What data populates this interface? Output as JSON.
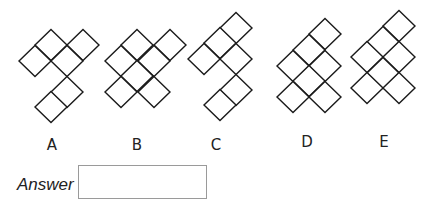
{
  "puzzle": {
    "cell": {
      "half_width": 16,
      "half_height": 15.5
    },
    "options": [
      {
        "label": "A",
        "label_x": 52,
        "label_y": 138,
        "squares": [
          [
            51,
            45
          ],
          [
            83,
            45
          ],
          [
            35,
            61
          ],
          [
            67,
            61
          ],
          [
            67,
            92
          ],
          [
            51,
            107
          ]
        ]
      },
      {
        "label": "B",
        "label_x": 137,
        "label_y": 138,
        "squares": [
          [
            137,
            45
          ],
          [
            170,
            45
          ],
          [
            121,
            61
          ],
          [
            154,
            61
          ],
          [
            137,
            76
          ],
          [
            121,
            92
          ],
          [
            154,
            92
          ]
        ]
      },
      {
        "label": "C",
        "label_x": 216,
        "label_y": 138,
        "squares": [
          [
            236,
            28
          ],
          [
            220,
            43
          ],
          [
            204,
            59
          ],
          [
            236,
            59
          ],
          [
            236,
            90
          ],
          [
            220,
            105
          ]
        ]
      },
      {
        "label": "D",
        "label_x": 307,
        "label_y": 135,
        "squares": [
          [
            325,
            34
          ],
          [
            309,
            50
          ],
          [
            293,
            66
          ],
          [
            325,
            66
          ],
          [
            309,
            81
          ],
          [
            293,
            97
          ],
          [
            325,
            97
          ]
        ]
      },
      {
        "label": "E",
        "label_x": 384,
        "label_y": 135,
        "squares": [
          [
            399,
            26
          ],
          [
            383,
            42
          ],
          [
            367,
            57
          ],
          [
            399,
            57
          ],
          [
            383,
            73
          ],
          [
            367,
            88
          ],
          [
            399,
            88
          ]
        ]
      }
    ]
  },
  "answer": {
    "label": "Answer",
    "value": ""
  }
}
